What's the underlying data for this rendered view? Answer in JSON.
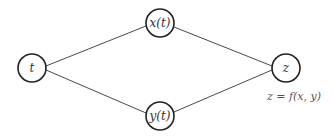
{
  "diagram": {
    "nodes": [
      {
        "id": "t",
        "label": "t",
        "cx": 32,
        "cy": 68
      },
      {
        "id": "x",
        "label": "x(t)",
        "cx": 160,
        "cy": 23
      },
      {
        "id": "y",
        "label": "y(t)",
        "cx": 160,
        "cy": 116
      },
      {
        "id": "z",
        "label": "z",
        "cx": 286,
        "cy": 68
      }
    ],
    "edges": [
      {
        "from": "t",
        "to": "x"
      },
      {
        "from": "t",
        "to": "y"
      },
      {
        "from": "x",
        "to": "z"
      },
      {
        "from": "y",
        "to": "z"
      }
    ],
    "caption": "z = f(x, y)"
  },
  "colors": {
    "stroke": "#222222",
    "edge": "#4a4a4a",
    "background": "#ffffff"
  }
}
